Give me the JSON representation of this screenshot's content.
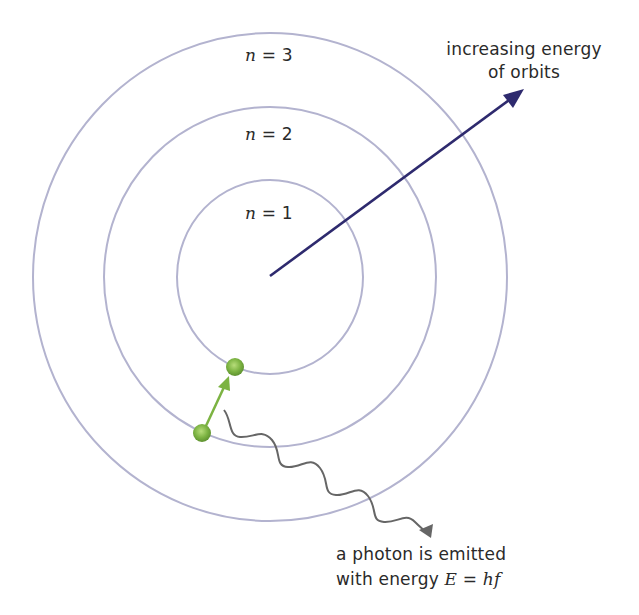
{
  "diagram": {
    "orbits": [
      {
        "label_var": "n",
        "label_eq": " = ",
        "label_num": "1",
        "cx": 270,
        "cy": 277,
        "rx": 93,
        "ry": 97
      },
      {
        "label_var": "n",
        "label_eq": " = ",
        "label_num": "2",
        "cx": 270,
        "cy": 277,
        "rx": 166,
        "ry": 170
      },
      {
        "label_var": "n",
        "label_eq": " = ",
        "label_num": "3",
        "cx": 270,
        "cy": 277,
        "rx": 237,
        "ry": 244
      }
    ],
    "energy_arrow": {
      "line1": "increasing energy",
      "line2": "of orbits",
      "color": "#2e2a6e"
    },
    "photon": {
      "line1": "a photon is emitted",
      "line2_prefix": "with energy ",
      "var_E": "E",
      "eq": " = ",
      "var_hf": "hf",
      "color": "#666666"
    },
    "electron": {
      "color": "#7cb342",
      "transition_color": "#7cb342"
    },
    "orbit_color": "#b3b3cf"
  }
}
